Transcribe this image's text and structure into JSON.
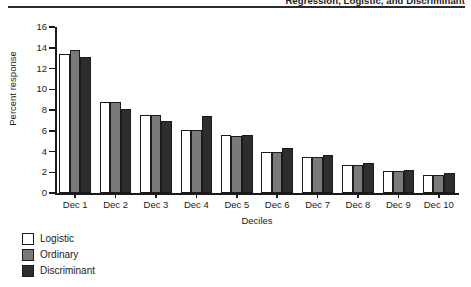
{
  "running_head": {
    "text": "Regression, Logistic, and Discriminant"
  },
  "chart_data": {
    "type": "bar",
    "title": "",
    "xlabel": "Deciles",
    "ylabel": "Percent response",
    "categories": [
      "Dec 1",
      "Dec 2",
      "Dec 3",
      "Dec 4",
      "Dec 5",
      "Dec 6",
      "Dec 7",
      "Dec 8",
      "Dec 9",
      "Dec 10"
    ],
    "series": [
      {
        "name": "Logistic",
        "color": "#ffffff",
        "values": [
          13.4,
          8.8,
          7.5,
          6.1,
          5.6,
          4.0,
          3.5,
          2.7,
          2.1,
          1.7
        ]
      },
      {
        "name": "Ordinary",
        "color": "#7a7a7a",
        "values": [
          13.8,
          8.8,
          7.5,
          6.1,
          5.5,
          4.0,
          3.5,
          2.7,
          2.1,
          1.7
        ]
      },
      {
        "name": "Discriminant",
        "color": "#2e2e2e",
        "values": [
          13.1,
          8.1,
          6.9,
          7.4,
          5.6,
          4.3,
          3.7,
          2.9,
          2.2,
          1.9
        ]
      }
    ],
    "ylim": [
      0,
      16
    ],
    "yticks": [
      0,
      2,
      4,
      6,
      8,
      10,
      12,
      14,
      16
    ],
    "grid": false,
    "legend_position": "below-left"
  }
}
